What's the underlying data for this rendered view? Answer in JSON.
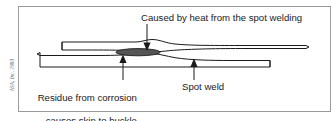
{
  "figure": {
    "credit": "ASA, Inc.  1993",
    "border_color": "#9a9a9a",
    "line_color": "#1a1a1a",
    "residue_fill": "#555555",
    "background": "#ffffff"
  },
  "labels": {
    "heat": "Caused by heat from the spot welding",
    "residue_line1": "Residue from corrosion",
    "residue_line2": "causes skin to buckle",
    "spot_weld": "Spot weld"
  },
  "callouts": [
    {
      "name": "heat-callout",
      "label": "Caused by heat from the spot welding",
      "direction": "down",
      "target": "upper skin buckle"
    },
    {
      "name": "residue-callout",
      "label": "Residue from corrosion causes skin to buckle",
      "direction": "up",
      "target": "corrosion residue between skins"
    },
    {
      "name": "spot-weld-callout",
      "label": "Spot weld",
      "direction": "up",
      "target": "spot weld joint"
    }
  ],
  "parts": [
    {
      "name": "upper-skin",
      "description": "Upper metal skin panel with buckle"
    },
    {
      "name": "lower-skin",
      "description": "Lower metal skin panel with buckle"
    },
    {
      "name": "corrosion-residue",
      "description": "Dark lens of corrosion residue between skins"
    }
  ]
}
